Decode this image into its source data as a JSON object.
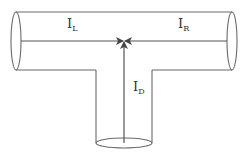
{
  "diagram": {
    "type": "T-junction pipe flow",
    "labels": {
      "left": {
        "main": "I",
        "sub": "L"
      },
      "right": {
        "main": "I",
        "sub": "R"
      },
      "down": {
        "main": "I",
        "sub": "D"
      }
    },
    "flows": [
      {
        "name": "I_L",
        "direction": "left-to-center"
      },
      {
        "name": "I_R",
        "direction": "right-to-center"
      },
      {
        "name": "I_D",
        "direction": "bottom-to-center"
      }
    ],
    "colors": {
      "line": "#6a6a6a",
      "arrow": "#555555",
      "text": "#333333"
    }
  }
}
